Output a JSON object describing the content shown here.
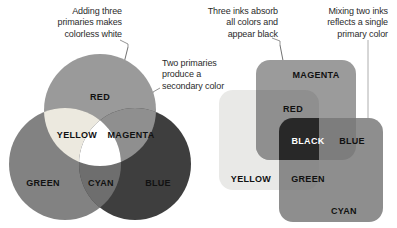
{
  "figure": {
    "background": "#ffffff"
  },
  "annotations": [
    {
      "id": "additive-white",
      "text": "Adding three\nprimaries makes\ncolorless white",
      "align": "right"
    },
    {
      "id": "secondary-color",
      "text": "Two primaries\nproduce a\nsecondary color",
      "align": "left"
    },
    {
      "id": "subtractive-black",
      "text": "Three inks absorb\nall colors and\nappear black",
      "align": "right"
    },
    {
      "id": "primary-color",
      "text": "Mixing two inks\nreflects a single\nprimary color",
      "align": "right"
    }
  ],
  "additive_diagram": {
    "name": "additive-color-venn",
    "shape": "circles",
    "labels": {
      "red": "RED",
      "green": "GREEN",
      "blue": "BLUE",
      "yellow": "YELLOW",
      "magenta": "MAGENTA",
      "cyan": "CYAN"
    },
    "colors": {
      "red": "#9a9a9a",
      "green": "#828282",
      "blue": "#3e3e3e",
      "yellow": "#ece9df",
      "magenta": "#8f8f8f",
      "cyan": "#6e6e6e",
      "white": "#ffffff"
    }
  },
  "subtractive_diagram": {
    "name": "subtractive-color-squares",
    "shape": "rounded-squares",
    "labels": {
      "magenta": "MAGENTA",
      "yellow": "YELLOW",
      "cyan": "CYAN",
      "red": "RED",
      "green": "GREEN",
      "blue": "BLUE",
      "black": "BLACK"
    },
    "colors": {
      "magenta": "#9b9b9b",
      "yellow": "#e9e9e7",
      "cyan": "#8e8e8e",
      "red": "#8f8f8f",
      "green": "#8a8a8a",
      "blue": "#7d7d7d",
      "black": "#282828"
    }
  }
}
